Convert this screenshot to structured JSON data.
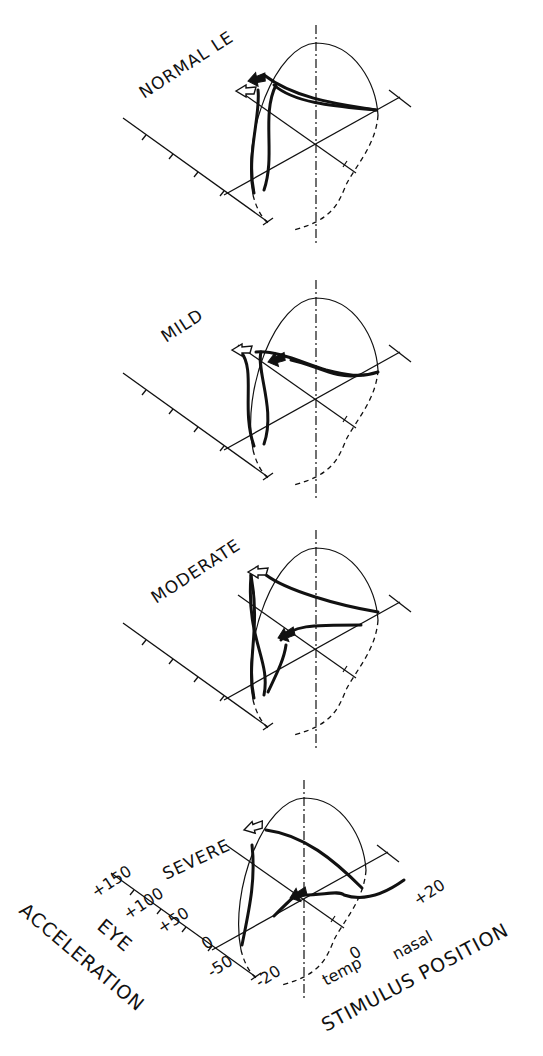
{
  "figure": {
    "panels": [
      {
        "id": "normal",
        "title": "NORMAL LE",
        "offset_y": 0
      },
      {
        "id": "mild",
        "title": "MILD",
        "offset_y": 253
      },
      {
        "id": "moderate",
        "title": "MODERATE",
        "offset_y": 505
      },
      {
        "id": "severe",
        "title": "SEVERE",
        "offset_y": 770
      }
    ],
    "axes": {
      "eye_acceleration": {
        "title_line1": "EYE",
        "title_line2": "ACCELERATION",
        "ticks": [
          "+150",
          "+100",
          "+50",
          "0",
          "-50"
        ]
      },
      "stimulus_position": {
        "title": "STIMULUS POSITION",
        "ticks": [
          "-20",
          "0",
          "+20"
        ],
        "direction_labels": {
          "temporal": "temp",
          "nasal": "nasal"
        }
      }
    },
    "markers": {
      "open_arrow": "open-arrow-icon",
      "filled_arrow": "filled-arrow-icon"
    },
    "colors": {
      "ink": "#111111",
      "background": "#ffffff"
    }
  }
}
